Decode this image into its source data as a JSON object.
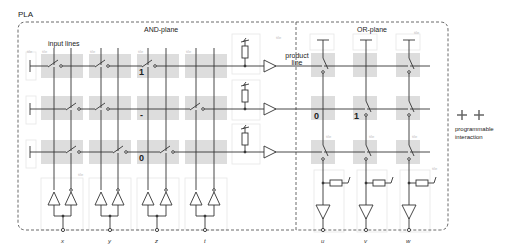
{
  "diagram": {
    "title": "PLA",
    "and_plane_label": "AND-plane",
    "or_plane_label": "OR-plane",
    "input_lines_label": "input lines",
    "product_line_label": "product\nline",
    "product_line_label_1": "product",
    "product_line_label_2": "line",
    "tile_label": "tile",
    "legend": {
      "label_1": "programmable",
      "label_2": "interaction"
    },
    "inputs": [
      "x",
      "y",
      "z",
      "t"
    ],
    "outputs": [
      "u",
      "v",
      "w"
    ],
    "and_values": {
      "row1_z": "1",
      "row2_z": "-",
      "row3_z": "0"
    },
    "or_values": {
      "row2_u": "0",
      "row2_v": "1"
    },
    "colors": {
      "line": "#333333",
      "tile_fill": "#dddddd",
      "tile_outline": "#e8e8e8",
      "border_dash": "#444444"
    }
  }
}
